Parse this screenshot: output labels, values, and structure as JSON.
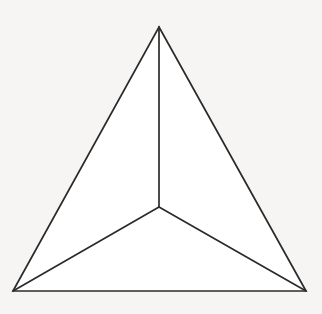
{
  "figure": {
    "shape_name": "subdivided-triangle",
    "background_color": "#f6f5f4",
    "fill_color": "#ffffff",
    "stroke_color": "#2b2b2b",
    "stroke_width": 1.7,
    "canvas": {
      "width": 322,
      "height": 314
    },
    "vertices": [
      {
        "name": "apex",
        "label": "Top vertex",
        "x": 159,
        "y": 27
      },
      {
        "name": "bottom-left",
        "label": "Bottom-left vertex",
        "x": 13,
        "y": 291
      },
      {
        "name": "bottom-right",
        "label": "Bottom-right vertex",
        "x": 306,
        "y": 291
      },
      {
        "name": "center",
        "label": "Interior junction point",
        "x": 159,
        "y": 207
      }
    ],
    "outline_path": "M 159 27 L 306 291 L 13 291 Z",
    "regions": [
      {
        "name": "left-region",
        "label": "Left region",
        "path": "M 159 27 L 159 207 L 13 291 Z"
      },
      {
        "name": "right-region",
        "label": "Right region",
        "path": "M 159 27 L 306 291 L 159 207 Z"
      },
      {
        "name": "bottom-region",
        "label": "Bottom region",
        "path": "M 159 207 L 306 291 L 13 291 Z"
      }
    ],
    "spokes": [
      {
        "name": "spoke-center-to-apex",
        "label": "Segment from center to top vertex",
        "x1": 159,
        "y1": 207,
        "x2": 159,
        "y2": 27
      },
      {
        "name": "spoke-center-to-bottom-left",
        "label": "Segment from center to bottom-left vertex",
        "x1": 159,
        "y1": 207,
        "x2": 13,
        "y2": 291
      },
      {
        "name": "spoke-center-to-bottom-right",
        "label": "Segment from center to bottom-right vertex",
        "x1": 159,
        "y1": 207,
        "x2": 306,
        "y2": 291
      }
    ]
  }
}
